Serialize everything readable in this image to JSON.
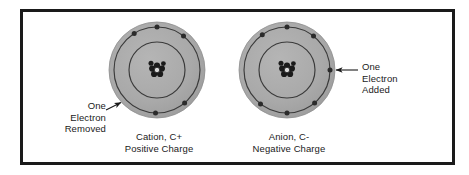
{
  "figure": {
    "background_color": "#ffffff",
    "border_color": "#1a1a1a",
    "atom_fill_color": "#a8a8a8",
    "orbit_line_color": "#3a3a3a",
    "electron_color": "#2b2b2b",
    "nucleus_color": "#1a1a1a",
    "text_color": "#1a1a1a"
  },
  "annotations": {
    "left": {
      "name": "one-electron-removed",
      "text": "One\nElectron\nRemoved"
    },
    "right": {
      "name": "one-electron-added",
      "text": "One\nElectron\nAdded"
    }
  },
  "atoms": [
    {
      "id": "cation",
      "caption": "Cation, C+\nPositive Charge",
      "caption_line1": "Cation, C+",
      "caption_line2": "Positive Charge",
      "center_x": 157,
      "center_y": 70,
      "body_radius": 48,
      "outer_orbit_radius": 43,
      "inner_orbit_radius": 28,
      "nucleus_particle_count": 7,
      "outer_shell_electrons": 5,
      "inner_shell_electrons": 0,
      "outer_electron_angles_deg": [
        -122,
        -90,
        -52,
        50,
        92
      ],
      "charge": "+1"
    },
    {
      "id": "anion",
      "caption": "Anion, C-\nNegative Charge",
      "caption_line1": "Anion, C-",
      "caption_line2": "Negative Charge",
      "center_x": 287,
      "center_y": 70,
      "body_radius": 48,
      "outer_orbit_radius": 43,
      "inner_orbit_radius": 28,
      "nucleus_particle_count": 7,
      "outer_shell_electrons": 7,
      "inner_shell_electrons": 0,
      "outer_electron_angles_deg": [
        -125,
        -90,
        -52,
        0,
        50,
        90,
        128
      ],
      "charge": "-1"
    }
  ]
}
